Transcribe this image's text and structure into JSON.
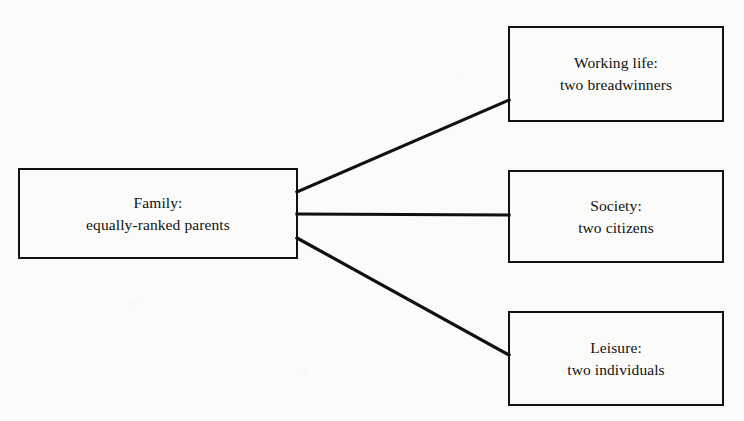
{
  "diagram": {
    "type": "hierarchy-fan",
    "background_color": "#fbfbfa",
    "line_color": "#111111",
    "nodes": {
      "family": {
        "label_line1": "Family:",
        "label_line2": "equally-ranked parents"
      },
      "working_life": {
        "label_line1": "Working life:",
        "label_line2": "two breadwinners"
      },
      "society": {
        "label_line1": "Society:",
        "label_line2": "two citizens"
      },
      "leisure": {
        "label_line1": "Leisure:",
        "label_line2": "two individuals"
      }
    },
    "connectors": [
      {
        "from": "family",
        "to": "working_life",
        "shape": "diagonal-up"
      },
      {
        "from": "family",
        "to": "society",
        "shape": "horizontal"
      },
      {
        "from": "family",
        "to": "leisure",
        "shape": "diagonal-down"
      }
    ]
  }
}
